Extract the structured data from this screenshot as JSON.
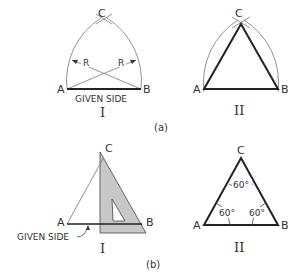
{
  "figure": {
    "panel_a": {
      "caption": "(a)",
      "step_1": {
        "numeral": "I",
        "points": {
          "A": "A",
          "B": "B",
          "C": "C"
        },
        "radius_label_left": "R",
        "radius_label_right": "R",
        "base_label": "GIVEN SIDE"
      },
      "step_2": {
        "numeral": "II",
        "points": {
          "A": "A",
          "B": "B",
          "C": "C"
        }
      }
    },
    "panel_b": {
      "caption": "(b)",
      "step_1": {
        "numeral": "I",
        "points": {
          "A": "A",
          "B": "B",
          "C": "C"
        },
        "base_label": "GIVEN SIDE"
      },
      "step_2": {
        "numeral": "II",
        "points": {
          "A": "A",
          "B": "B",
          "C": "C"
        },
        "angle_top": "60°",
        "angle_left": "60°",
        "angle_right": "60°"
      }
    },
    "colors": {
      "line": "#222222",
      "thin_line": "#777777",
      "set_square_fill": "#c8c8c8"
    }
  }
}
